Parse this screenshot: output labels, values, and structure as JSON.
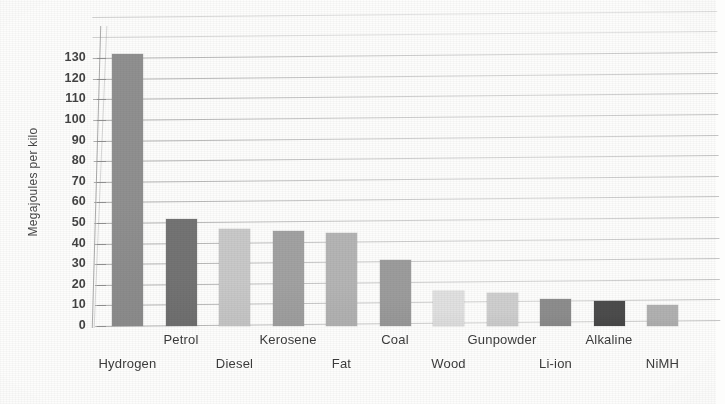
{
  "chart_data": {
    "type": "bar",
    "title": "",
    "xlabel": "",
    "ylabel": "Megajoules per kilo",
    "ylim": [
      0,
      130
    ],
    "ytick_step": 10,
    "yticks": [
      "130",
      "120",
      "110",
      "100",
      "90",
      "80",
      "70",
      "60",
      "50",
      "40",
      "30",
      "20",
      "10",
      "0"
    ],
    "grid": true,
    "legend": "none",
    "categories": [
      "Hydrogen",
      "Petrol",
      "Diesel",
      "Kerosene",
      "Fat",
      "Coal",
      "Wood",
      "Gunpowder",
      "Li-ion",
      "Alkaline",
      "NiMH"
    ],
    "values": [
      132,
      52,
      47,
      46,
      45,
      32,
      17,
      16,
      13,
      12,
      10
    ],
    "bar_colors": [
      "#8d8d8d",
      "#6f6f6f",
      "#c9c9c9",
      "#a0a0a0",
      "#b4b4b4",
      "#9a9a9a",
      "#e2e2e2",
      "#cfcfcf",
      "#8a8a8a",
      "#454545",
      "#b0b0b0"
    ],
    "label_rows": [
      "b",
      "a",
      "b",
      "a",
      "b",
      "a",
      "b",
      "a",
      "b",
      "a",
      "b"
    ]
  },
  "axis": {
    "y_label": "Megajoules per kilo"
  },
  "figure": {
    "background": "#fdfdfc",
    "gridline_color": "#a5a5a5",
    "text_color": "#3b3b3b"
  }
}
